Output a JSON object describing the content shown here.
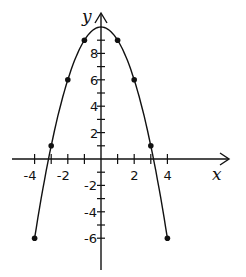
{
  "chart_data": {
    "type": "line",
    "title": "",
    "xlabel": "x",
    "ylabel": "y",
    "function": "y = 10 - x^2",
    "xlim": [
      -5.5,
      6
    ],
    "ylim": [
      -8,
      11.5
    ],
    "grid": false,
    "x_ticks": [
      -4,
      -3,
      -2,
      -1,
      1,
      2,
      3,
      4
    ],
    "x_tick_labels": [
      "-4",
      "-2",
      "2",
      "4"
    ],
    "y_ticks": [
      -6,
      -5,
      -4,
      -3,
      -2,
      -1,
      1,
      2,
      3,
      4,
      5,
      6,
      7,
      8,
      9
    ],
    "y_tick_labels": [
      "-6",
      "-4",
      "-2",
      "2",
      "4",
      "6",
      "8"
    ],
    "points": [
      {
        "x": -4,
        "y": -6
      },
      {
        "x": -3,
        "y": 1
      },
      {
        "x": -2,
        "y": 6
      },
      {
        "x": -1,
        "y": 9
      },
      {
        "x": 0,
        "y": 10
      },
      {
        "x": 1,
        "y": 9
      },
      {
        "x": 2,
        "y": 6
      },
      {
        "x": 3,
        "y": 1
      },
      {
        "x": 4,
        "y": -6
      }
    ],
    "color": "#111111"
  }
}
